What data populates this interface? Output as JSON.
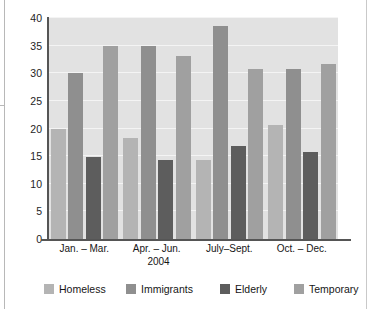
{
  "chart_data": {
    "type": "bar",
    "title": "",
    "xlabel": "2004",
    "ylabel": "Percentage of Total Number",
    "ylim": [
      0,
      40
    ],
    "yticks": [
      "0",
      "5",
      "10",
      "15",
      "20",
      "25",
      "30",
      "35",
      "40"
    ],
    "ytick_values": [
      0,
      5,
      10,
      15,
      20,
      25,
      30,
      35,
      40
    ],
    "grid": true,
    "legend_position": "bottom",
    "categories": [
      "Jan. – Mar.",
      "Apr. – Jun.",
      "July–Sept.",
      "Oct. – Dec."
    ],
    "series": [
      {
        "name": "Homeless",
        "color": "#b4b4b4",
        "values": [
          20,
          18.2,
          14.3,
          20.7
        ]
      },
      {
        "name": "Immigrants",
        "color": "#8f8f8f",
        "values": [
          30,
          35,
          38.5,
          30.7
        ]
      },
      {
        "name": "Elderly",
        "color": "#5d5d5d",
        "values": [
          14.9,
          14.3,
          16.9,
          15.7
        ]
      },
      {
        "name": "Temporary",
        "color": "#a0a0a0",
        "values": [
          35,
          33.2,
          30.8,
          31.7
        ]
      }
    ]
  },
  "colors": {
    "plot_background": "#e2e2e2",
    "gridline": "#f4f4f4",
    "axis": "#555555",
    "text": "#161616",
    "page_background": "#ffffff"
  }
}
